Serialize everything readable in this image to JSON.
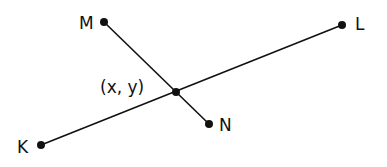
{
  "diagram": {
    "points": [
      {
        "id": "M",
        "label": "M",
        "x": 104,
        "y": 22
      },
      {
        "id": "N",
        "label": "N",
        "x": 209,
        "y": 124
      },
      {
        "id": "K",
        "label": "K",
        "x": 41,
        "y": 145
      },
      {
        "id": "L",
        "label": "L",
        "x": 342,
        "y": 25
      },
      {
        "id": "P",
        "label": "(x, y)",
        "x": 176,
        "y": 92
      }
    ],
    "segments": [
      {
        "from": "K",
        "to": "L"
      },
      {
        "from": "M",
        "to": "N"
      }
    ],
    "colors": {
      "stroke": "#111111",
      "background": "#ffffff"
    }
  }
}
